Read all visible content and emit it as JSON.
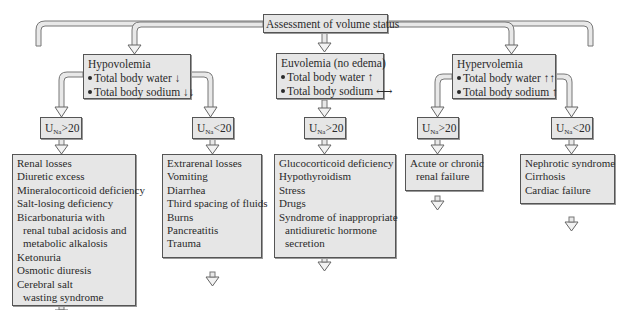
{
  "title": "Assessment of volume status",
  "branches": [
    {
      "id": "hypovolemia",
      "heading": "Hypovolemia",
      "bullets": [
        "Total body water ↓",
        "Total body sodium ↓↓"
      ],
      "subbranches": [
        {
          "test": {
            "prefix": "U",
            "sub": "Na",
            "op": ">20"
          },
          "causes": [
            "Renal losses",
            "Diuretic excess",
            "Mineralocorticoid deficiency",
            "Salt-losing deficiency",
            "Bicarbonaturia with",
            "renal tubal acidosis and",
            "metabolic alkalosis",
            "Ketonuria",
            "Osmotic diuresis",
            "Cerebral salt",
            "wasting syndrome"
          ]
        },
        {
          "test": {
            "prefix": "U",
            "sub": "Na",
            "op": "<20"
          },
          "causes": [
            "Extrarenal losses",
            "Vomiting",
            "Diarrhea",
            "Third spacing of fluids",
            "Burns",
            "Pancreatitis",
            "Trauma"
          ]
        }
      ]
    },
    {
      "id": "euvolemia",
      "heading": "Euvolemia (no edema)",
      "bullets": [
        "Total body water ↑",
        "Total body sodium ⟷"
      ],
      "subbranches": [
        {
          "test": {
            "prefix": "U",
            "sub": "Na",
            "op": ">20"
          },
          "causes": [
            "Glucocorticoid deficiency",
            "Hypothyroidism",
            "Stress",
            "Drugs",
            "Syndrome of inappropriate",
            "antidiuretic hormone",
            "secretion"
          ]
        }
      ]
    },
    {
      "id": "hypervolemia",
      "heading": "Hypervolemia",
      "bullets": [
        "Total body water ↑↑",
        "Total body sodium ↑"
      ],
      "subbranches": [
        {
          "test": {
            "prefix": "U",
            "sub": "Na",
            "op": ">20"
          },
          "causes": [
            "Acute or chronic",
            "renal failure"
          ]
        },
        {
          "test": {
            "prefix": "U",
            "sub": "Na",
            "op": "<20"
          },
          "causes": [
            "Nephrotic syndrome",
            "Cirrhosis",
            "Cardiac failure"
          ]
        }
      ]
    }
  ],
  "colors": {
    "box_fill": "#e6e6e6",
    "box_border": "#555555",
    "arrow_fill": "#dcdcdc",
    "arrow_stroke": "#666666"
  }
}
